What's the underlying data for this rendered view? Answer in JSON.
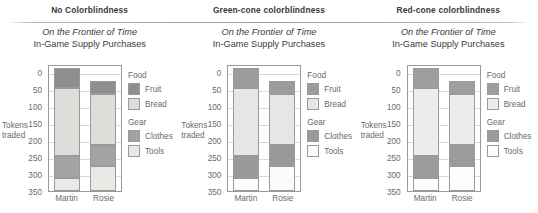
{
  "panels": [
    {
      "header": "No Colorblindness",
      "palette": {
        "fruit": "#8e8e8e",
        "bread": "#dcdcd8",
        "clothes": "#a3a3a3",
        "tools": "#e9e9e5"
      }
    },
    {
      "header": "Green-cone colorblindness",
      "palette": {
        "fruit": "#9c9c9c",
        "bread": "#e6e6e4",
        "clothes": "#9a9a9a",
        "tools": "#fbfbfa"
      }
    },
    {
      "header": "Red-cone colorblindness",
      "palette": {
        "fruit": "#9e9e9e",
        "bread": "#ececeb",
        "clothes": "#9b9b9b",
        "tools": "#fdfdfc"
      }
    }
  ],
  "chart": {
    "title_line1": "On the Frontier of Time",
    "title_line2": "In-Game Supply Purchases",
    "ylabel_line1": "Tokens",
    "ylabel_line2": "traded",
    "yticks": [
      "350",
      "300",
      "250",
      "200",
      "150",
      "100",
      "50",
      "0"
    ],
    "legend": {
      "groups": [
        {
          "title": "Food",
          "items": [
            {
              "label": "Fruit",
              "key": "fruit"
            },
            {
              "label": "Bread",
              "key": "bread"
            }
          ]
        },
        {
          "title": "Gear",
          "items": [
            {
              "label": "Clothes",
              "key": "clothes"
            },
            {
              "label": "Tools",
              "key": "tools"
            }
          ]
        }
      ]
    }
  },
  "chart_data": {
    "type": "bar",
    "subtype": "stacked",
    "xlabel": "",
    "ylabel": "Tokens traded",
    "ylim": [
      0,
      375
    ],
    "yticks": [
      0,
      50,
      100,
      150,
      200,
      250,
      300,
      350
    ],
    "grid": true,
    "legend_position": "right",
    "categories": [
      "Martin",
      "Rosie"
    ],
    "stack_order": [
      "Tools",
      "Clothes",
      "Bread",
      "Fruit"
    ],
    "series": [
      {
        "name": "Tools",
        "values": [
          38,
          75
        ]
      },
      {
        "name": "Clothes",
        "values": [
          66,
          60
        ]
      },
      {
        "name": "Bread",
        "values": [
          201,
          150
        ]
      },
      {
        "name": "Fruit",
        "values": [
          57,
          40
        ]
      }
    ],
    "totals": [
      362,
      325
    ],
    "cumulative_tops": {
      "Martin": {
        "Tools": 38,
        "Clothes": 104,
        "Bread": 305,
        "Fruit": 362
      },
      "Rosie": {
        "Tools": 75,
        "Clothes": 135,
        "Bread": 285,
        "Fruit": 325
      }
    },
    "repeated_across_panels": 3,
    "panel_headers": [
      "No Colorblindness",
      "Green-cone colorblindness",
      "Red-cone colorblindness"
    ]
  }
}
